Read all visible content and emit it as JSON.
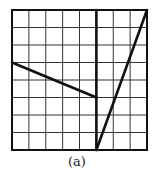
{
  "figure": {
    "caption": "(a)",
    "grid": {
      "cols": 8,
      "rows": 8,
      "left": 12,
      "top": 10,
      "right": 147,
      "bottom": 150
    },
    "colors": {
      "grid": "#333333",
      "line": "#111111",
      "background": "#ffffff"
    },
    "segments": [
      {
        "name": "descending-segment",
        "from": [
          0,
          3
        ],
        "to": [
          5,
          5
        ]
      },
      {
        "name": "vertical-segment",
        "from": [
          5,
          0
        ],
        "to": [
          5,
          8
        ]
      },
      {
        "name": "steep-segment",
        "from": [
          5,
          8
        ],
        "to": [
          8,
          0
        ]
      }
    ]
  }
}
